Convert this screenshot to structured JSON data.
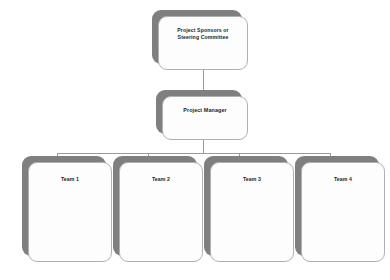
{
  "diagram": {
    "type": "org-chart",
    "background_color": "#ffffff",
    "line_color": "#9a9a9a",
    "box_fill_color": "#fdfdfd",
    "box_border_color": "#b0b0b0",
    "shadow_color": "#7f7f7f",
    "text_color": "#231f20",
    "levels": [
      {
        "level": 1,
        "nodes": [
          {
            "id": "sponsors",
            "label": "Project Sponsors or Steering Committee"
          }
        ]
      },
      {
        "level": 2,
        "nodes": [
          {
            "id": "manager",
            "label": "Project Manager"
          }
        ]
      },
      {
        "level": 3,
        "nodes": [
          {
            "id": "team-1",
            "label": "Team 1"
          },
          {
            "id": "team-2",
            "label": "Team 2"
          },
          {
            "id": "team-3",
            "label": "Team 3"
          },
          {
            "id": "team-4",
            "label": "Team 4"
          }
        ]
      }
    ],
    "nodes": {
      "sponsors": {
        "label_line_1": "Project Sponsors or",
        "label_line_2": "Steering Committee"
      },
      "manager": {
        "label": "Project Manager"
      },
      "team_1": {
        "label": "Team 1"
      },
      "team_2": {
        "label": "Team 2"
      },
      "team_3": {
        "label": "Team 3"
      },
      "team_4": {
        "label": "Team 4"
      }
    },
    "edges": [
      {
        "from": "sponsors",
        "to": "manager"
      },
      {
        "from": "manager",
        "to": "team-1"
      },
      {
        "from": "manager",
        "to": "team-2"
      },
      {
        "from": "manager",
        "to": "team-3"
      },
      {
        "from": "manager",
        "to": "team-4"
      }
    ]
  }
}
